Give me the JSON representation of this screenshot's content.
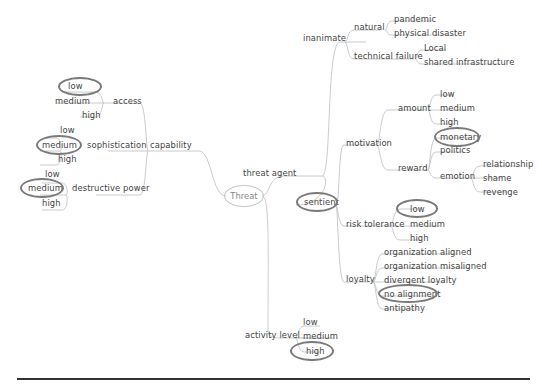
{
  "diagram": {
    "type": "mind-map",
    "root": "Threat",
    "left": {
      "capability": {
        "label": "capability",
        "children": [
          {
            "label": "access",
            "options": [
              "low",
              "medium",
              "high"
            ],
            "selected": "low"
          },
          {
            "label": "sophistication",
            "options": [
              "low",
              "medium",
              "high"
            ],
            "selected": "medium"
          },
          {
            "label": "destructive power",
            "options": [
              "low",
              "medium",
              "high"
            ],
            "selected": "medium"
          }
        ]
      }
    },
    "right": {
      "threat_agent": {
        "label": "threat agent",
        "inanimate": {
          "label": "inanimate",
          "natural": {
            "label": "natural",
            "items": [
              "pandemic",
              "physical disaster"
            ]
          },
          "technical_failure": {
            "label": "technical failure",
            "items": [
              "Local",
              "shared infrastructure"
            ]
          }
        },
        "sentient": {
          "label": "sentient",
          "selected": true,
          "motivation": {
            "label": "motivation",
            "amount": {
              "label": "amount",
              "items": [
                "low",
                "medium",
                "high"
              ]
            },
            "reward": {
              "label": "reward",
              "items": [
                "monetary",
                "politics"
              ],
              "selected": "monetary",
              "emotion": {
                "label": "emotion",
                "items": [
                  "relationship",
                  "shame",
                  "revenge"
                ]
              }
            }
          },
          "risk_tolerance": {
            "label": "risk tolerance",
            "items": [
              "low",
              "medium",
              "high"
            ],
            "selected": "low"
          },
          "loyalty": {
            "label": "loyalty",
            "items": [
              "organization aligned",
              "organization misaligned",
              "divergent loyalty",
              "no alignment",
              "antipathy"
            ],
            "selected": "no alignment"
          }
        }
      },
      "activity_level": {
        "label": "activity level",
        "items": [
          "low",
          "medium",
          "high"
        ],
        "selected": "high"
      }
    },
    "colors": {
      "branch": "#c4c4c4",
      "highlight_ring": "#7a7a7a",
      "text": "#444444",
      "rule": "#333333"
    }
  }
}
